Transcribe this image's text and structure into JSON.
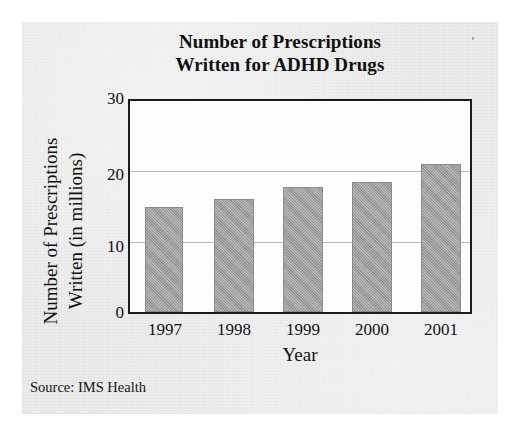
{
  "figure": {
    "source_note": "Source: IMS Health",
    "paper_color": "#ececec",
    "bar_color": "#9b9b9b",
    "axis_color": "#1c1c1c",
    "gridline_color": "#b9b9b9"
  },
  "chart_data": {
    "type": "bar",
    "title": "Number of Prescriptions Written for ADHD Drugs",
    "title_line1": "Number of Prescriptions",
    "title_line2": "Written for ADHD Drugs",
    "xlabel": "Year",
    "ylabel": "Number of Prescriptions Written (in millions)",
    "ylabel_line1": "Number of Prescriptions",
    "ylabel_line2": "Written (in millions)",
    "categories": [
      "1997",
      "1998",
      "1999",
      "2000",
      "2001"
    ],
    "values": [
      15,
      16,
      17.8,
      18.5,
      21
    ],
    "ylim": [
      0,
      30
    ],
    "yticks": [
      "0",
      "10",
      "20",
      "30"
    ],
    "ytick_values": [
      0,
      10,
      20,
      30
    ],
    "grid": true,
    "grid_axis": "y",
    "legend": "none"
  }
}
